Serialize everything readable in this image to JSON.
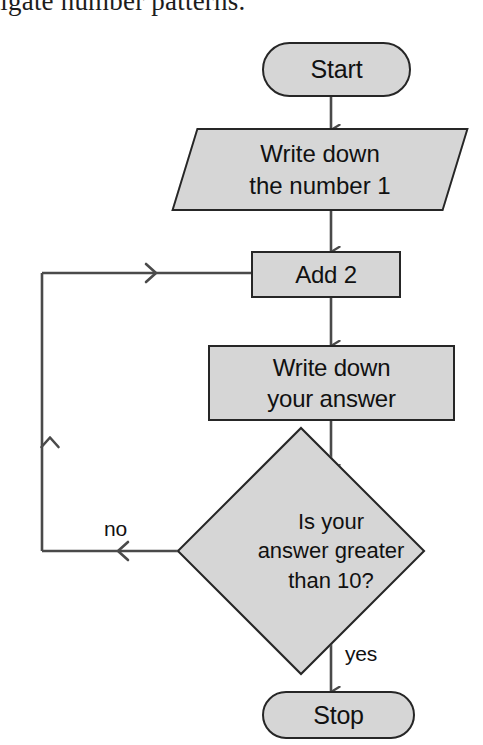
{
  "page": {
    "caption_partial": "vestigate number patterns.",
    "background_color": "#ffffff"
  },
  "theme": {
    "node_fill": "#d6d6d6",
    "node_stroke": "#262626",
    "connector_stroke": "#4a4a4a",
    "text_color": "#111111"
  },
  "flowchart": {
    "title": "Number pattern flowchart",
    "nodes": [
      {
        "id": "start",
        "type": "terminator",
        "label": "Start"
      },
      {
        "id": "write1",
        "type": "input-output",
        "label": "Write down\nthe number 1"
      },
      {
        "id": "add2",
        "type": "process",
        "label": "Add 2"
      },
      {
        "id": "writeans",
        "type": "process",
        "label": "Write down\nyour answer"
      },
      {
        "id": "decide",
        "type": "decision",
        "label": "Is your\nanswer greater\nthan 10?"
      },
      {
        "id": "stop",
        "type": "terminator",
        "label": "Stop"
      }
    ],
    "edges": [
      {
        "from": "start",
        "to": "write1",
        "label": ""
      },
      {
        "from": "write1",
        "to": "add2",
        "label": ""
      },
      {
        "from": "add2",
        "to": "writeans",
        "label": ""
      },
      {
        "from": "writeans",
        "to": "decide",
        "label": ""
      },
      {
        "from": "decide",
        "to": "add2",
        "label": "no"
      },
      {
        "from": "decide",
        "to": "stop",
        "label": "yes"
      }
    ],
    "labels": {
      "no": "no",
      "yes": "yes"
    }
  }
}
